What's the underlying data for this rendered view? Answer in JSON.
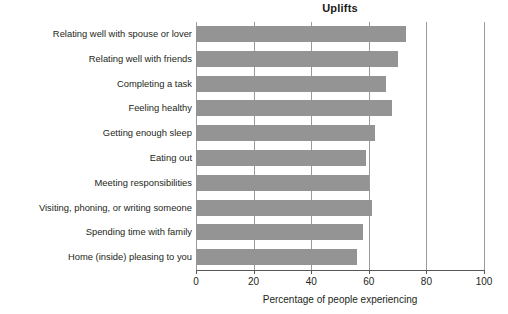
{
  "chart_data": {
    "type": "bar",
    "orientation": "horizontal",
    "title": "Uplifts",
    "xlabel": "Percentage of people experiencing",
    "ylabel": "",
    "xlim": [
      0,
      100
    ],
    "xticks": [
      0,
      20,
      40,
      60,
      80,
      100
    ],
    "xtick_labels": [
      "0",
      "20",
      "40",
      "60",
      "80",
      "100"
    ],
    "grid": "vertical",
    "legend": "none",
    "bar_color": "#949494",
    "axis_color": "#58585a",
    "gridline_color": "#9a9a9a",
    "categories": [
      "Relating well with spouse or lover",
      "Relating well with friends",
      "Completing a task",
      "Feeling healthy",
      "Getting enough sleep",
      "Eating out",
      "Meeting responsibilities",
      "Visiting, phoning, or writing someone",
      "Spending time with family",
      "Home (inside) pleasing to you"
    ],
    "values": [
      73,
      70,
      66,
      68,
      62,
      59,
      60,
      61,
      58,
      56
    ]
  }
}
